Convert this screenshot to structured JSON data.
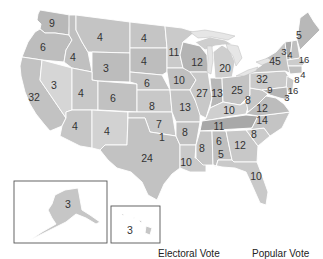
{
  "electoral_votes": {
    "WA": "9",
    "OR": "6",
    "CA": "32",
    "NV": "3",
    "ID": "4",
    "MT": "4",
    "WY": "3",
    "UT": "4",
    "CO": "6",
    "AZ": "4",
    "NM": "4",
    "ND": "4",
    "SD": "4",
    "NE": "6",
    "KS": "8",
    "OK": [
      "7",
      "1"
    ],
    "TX": "24",
    "MN": "11",
    "IA": "10",
    "MO": "13",
    "AR": "8",
    "LA": "10",
    "WI": "12",
    "IL": "27",
    "MI": "20",
    "IN": "13",
    "OH": "25",
    "KY": "10",
    "TN": "11",
    "MS": "8",
    "AL": [
      "6",
      "5"
    ],
    "GA": "12",
    "FL": "10",
    "SC": "8",
    "NC": "14",
    "VA": "12",
    "WV": "8",
    "PA": "32",
    "NY": "45",
    "VT": "3",
    "NH": "4",
    "ME": "5",
    "MA": "16",
    "RI": "4",
    "CT": "8",
    "NJ": "16",
    "DE": "3",
    "MD": "9",
    "AK": "3",
    "HI": "3"
  },
  "legend": {
    "electoral_vote_label": "Electoral Vote",
    "popular_vote_label": "Popular Vote"
  },
  "colors": {
    "background": "#ffffff",
    "state_border": "#ffffff",
    "label": "#333333",
    "inset_frame": "#555555",
    "lakes": "#e6e6e6"
  }
}
